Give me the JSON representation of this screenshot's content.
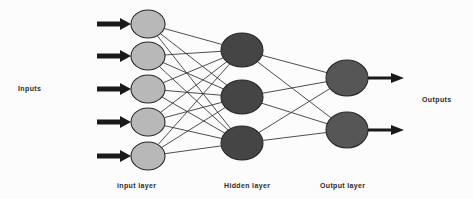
{
  "diagram": {
    "type": "feedforward-neural-network",
    "background_color": "#fcfcfc",
    "side_labels": {
      "inputs": "Inputs",
      "outputs": "Outputs"
    },
    "layer_labels": {
      "input": "input layer",
      "hidden": "Hidden layer",
      "output": "Output layer"
    },
    "colors": {
      "input_node_fill": "#b8b8b8",
      "hidden_node_fill": "#454545",
      "output_node_fill": "#565656",
      "node_stroke": "#2a2a2a",
      "connection_stroke": "#3a3a3a",
      "arrow_fill": "#1a1a1a",
      "label_text": "#2b2b2b"
    },
    "layers": [
      {
        "name": "input layer",
        "node_count": 5,
        "cx": 148,
        "rx": 17,
        "ry": 14,
        "fill": "#b8b8b8",
        "centers_y": [
          24,
          56,
          89,
          122,
          156
        ]
      },
      {
        "name": "Hidden layer",
        "node_count": 3,
        "cx": 242,
        "rx": 21,
        "ry": 17,
        "fill": "#454545",
        "centers_y": [
          50,
          97,
          143
        ]
      },
      {
        "name": "Output layer",
        "node_count": 2,
        "cx": 347,
        "rx": 21,
        "ry": 18,
        "fill": "#565656",
        "centers_y": [
          78,
          130
        ]
      }
    ],
    "input_arrows": {
      "count": 5,
      "x_start": 97,
      "x_end": 131,
      "shaft_thickness": 5,
      "head_length": 11,
      "head_half_height": 6,
      "centers_y": [
        24,
        56,
        89,
        122,
        156
      ]
    },
    "output_arrows": {
      "count": 2,
      "x_start": 368,
      "x_end": 404,
      "shaft_thickness": 3,
      "head_length": 13,
      "head_half_height": 5,
      "centers_y": [
        78,
        130
      ]
    },
    "connections": {
      "input_to_hidden": "fully-connected",
      "input_to_hidden_count": 15,
      "hidden_to_output": "fully-connected",
      "hidden_to_output_count": 6,
      "stroke_width": 0.9
    }
  }
}
